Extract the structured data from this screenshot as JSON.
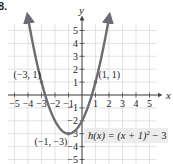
{
  "problem_number": "8.",
  "chart_data": {
    "type": "line",
    "title": "",
    "function_label": "h(x) = (x + 1)² − 3",
    "function_label_parts": {
      "lhs": "h(x) = (x + 1)",
      "exp": "2",
      "rhs": " − 3"
    },
    "xlabel": "x",
    "ylabel": "y",
    "xlim": [
      -5.5,
      5.5
    ],
    "ylim": [
      -5.5,
      5.5
    ],
    "grid": true,
    "x_ticks": [
      -5,
      -4,
      -3,
      -2,
      -1,
      1,
      2,
      3,
      4,
      5
    ],
    "y_ticks": [
      5,
      4,
      3,
      2,
      1,
      -1,
      -2,
      -3,
      -4,
      -5
    ],
    "x_tick_labels": [
      "−5",
      "−4",
      "−3",
      "−2",
      "−1",
      "1",
      "2",
      "3",
      "4",
      "5"
    ],
    "y_tick_labels": [
      "5",
      "4",
      "3",
      "2",
      "1",
      "−1",
      "−2",
      "−3",
      "−4",
      "−5"
    ],
    "series": [
      {
        "name": "h(x) = (x + 1)^2 - 3",
        "x": [
          -4,
          -3.5,
          -3,
          -2.5,
          -2,
          -1.5,
          -1,
          -0.5,
          0,
          0.5,
          1,
          1.5,
          2
        ],
        "y": [
          6,
          3.25,
          1,
          -0.75,
          -2,
          -2.75,
          -3,
          -2.75,
          -2,
          -0.75,
          1,
          3.25,
          6
        ],
        "color": "#6b6b73",
        "arrows_at_ends": true
      }
    ],
    "annotations": [
      {
        "label": "(−3, 1)",
        "x": -3,
        "y": 1
      },
      {
        "label": "(1, 1)",
        "x": 1,
        "y": 1
      },
      {
        "label": "(−1, −3)",
        "x": -1,
        "y": -3
      }
    ],
    "colors": {
      "curve": "#6b6b73",
      "grid": "#dcdcdc",
      "axis": "#444444",
      "label_box": "#ececec"
    }
  }
}
